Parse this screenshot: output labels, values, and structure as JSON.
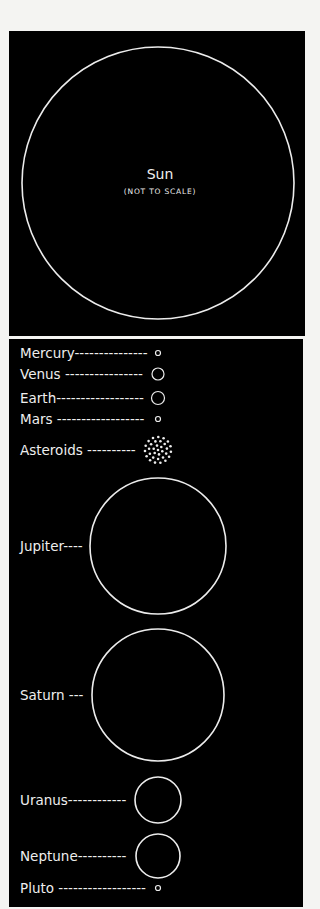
{
  "sun": {
    "name": "Sun",
    "note": "(NOT TO SCALE)"
  },
  "bodies": [
    {
      "label": "Mercury",
      "leader": "------------",
      "cy": 353,
      "r": 2.5,
      "type": "circle"
    },
    {
      "label": "Venus",
      "leader": " ---------------",
      "cy": 374,
      "r": 6,
      "type": "circle"
    },
    {
      "label": "Earth",
      "leader": "----------------",
      "cy": 398,
      "r": 6.5,
      "type": "circle"
    },
    {
      "label": "Mars",
      "leader": " ----------------",
      "cy": 419,
      "r": 2.5,
      "type": "circle"
    },
    {
      "label": "Asteroids",
      "leader": " ---------",
      "cy": 450,
      "r": 14,
      "type": "dots"
    },
    {
      "label": "Jupiter",
      "leader": "----",
      "cy": 546,
      "r": 68,
      "type": "circle"
    },
    {
      "label": "Saturn",
      "leader": " ----",
      "cy": 695,
      "r": 66,
      "type": "circle"
    },
    {
      "label": "Uranus",
      "leader": "-----------",
      "cy": 800,
      "r": 23,
      "type": "circle"
    },
    {
      "label": "Neptune",
      "leader": "---------",
      "cy": 856,
      "r": 22,
      "type": "circle"
    },
    {
      "label": "Pluto",
      "leader": " ----------------",
      "cy": 888,
      "r": 2.5,
      "type": "circle"
    }
  ],
  "colors": {
    "background": "#000000",
    "line": "#ececec",
    "page": "#f4f4f2"
  }
}
